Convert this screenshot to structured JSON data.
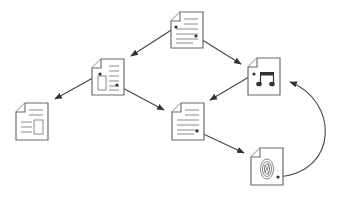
{
  "diagram": {
    "type": "document-link-graph",
    "colors": {
      "background": "#ffffff",
      "node_stroke": "#6b6b6b",
      "node_detail": "#8a8a8a",
      "edge": "#444444"
    },
    "nodes": [
      {
        "id": "doc-top",
        "kind": "text-document",
        "icon": "text-document-icon",
        "x": 171,
        "y": 12
      },
      {
        "id": "doc-left-mid",
        "kind": "mixed-document",
        "icon": "document-with-image-icon",
        "x": 92,
        "y": 59
      },
      {
        "id": "doc-music",
        "kind": "audio-document",
        "icon": "music-note-document-icon",
        "x": 248,
        "y": 58
      },
      {
        "id": "doc-bottom-left",
        "kind": "mixed-document",
        "icon": "document-with-image-icon",
        "x": 16,
        "y": 103
      },
      {
        "id": "doc-center",
        "kind": "text-document",
        "icon": "text-document-icon",
        "x": 172,
        "y": 103
      },
      {
        "id": "doc-fingerprint",
        "kind": "image-document",
        "icon": "fingerprint-document-icon",
        "x": 251,
        "y": 148
      }
    ],
    "edges": [
      {
        "from": "doc-top",
        "to": "doc-left-mid",
        "shape": "straight"
      },
      {
        "from": "doc-top",
        "to": "doc-music",
        "shape": "straight"
      },
      {
        "from": "doc-left-mid",
        "to": "doc-bottom-left",
        "shape": "straight"
      },
      {
        "from": "doc-left-mid",
        "to": "doc-center",
        "shape": "straight"
      },
      {
        "from": "doc-music",
        "to": "doc-center",
        "shape": "straight"
      },
      {
        "from": "doc-center",
        "to": "doc-fingerprint",
        "shape": "straight"
      },
      {
        "from": "doc-fingerprint",
        "to": "doc-music",
        "shape": "curved"
      }
    ]
  }
}
